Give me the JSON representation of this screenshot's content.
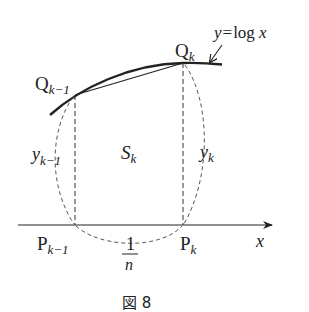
{
  "figure": {
    "caption": "図 8",
    "curve_label": {
      "lhs": "y",
      "eq": "=",
      "rhs": "log",
      "var": "x"
    },
    "points": {
      "q_prev": {
        "base": "Q",
        "sub": "k−1"
      },
      "q_k": {
        "base": "Q",
        "sub": "k"
      },
      "p_prev": {
        "base": "P",
        "sub": "k−1"
      },
      "p_k": {
        "base": "P",
        "sub": "k"
      }
    },
    "lengths": {
      "y_prev": {
        "base": "y",
        "sub": "k−1"
      },
      "y_k": {
        "base": "y",
        "sub": "k"
      },
      "width_num": "1",
      "width_den": "n"
    },
    "area": {
      "base": "S",
      "sub": "k"
    },
    "axis_label": "x",
    "colors": {
      "stroke": "#222222",
      "background": "#ffffff"
    }
  }
}
